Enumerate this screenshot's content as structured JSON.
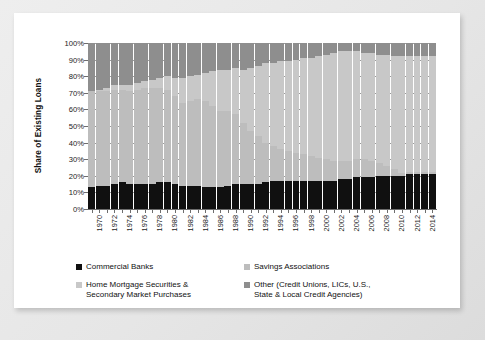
{
  "chart_data": {
    "type": "bar",
    "stacked": true,
    "stack_mode": "percent",
    "title": "",
    "xlabel": "",
    "ylabel": "Share of Existing Loans",
    "ylim": [
      0,
      100
    ],
    "ytick_labels": [
      "0%",
      "10%",
      "20%",
      "30%",
      "40%",
      "50%",
      "60%",
      "70%",
      "80%",
      "90%",
      "100%"
    ],
    "ytick_values": [
      0,
      10,
      20,
      30,
      40,
      50,
      60,
      70,
      80,
      90,
      100
    ],
    "grid": "horizontal-dashed",
    "legend_position": "bottom",
    "categories": [
      1970,
      1971,
      1972,
      1973,
      1974,
      1975,
      1976,
      1977,
      1978,
      1979,
      1980,
      1981,
      1982,
      1983,
      1984,
      1985,
      1986,
      1987,
      1988,
      1989,
      1990,
      1991,
      1992,
      1993,
      1994,
      1995,
      1996,
      1997,
      1998,
      1999,
      2000,
      2001,
      2002,
      2003,
      2004,
      2005,
      2006,
      2007,
      2008,
      2009,
      2010,
      2011,
      2012,
      2013,
      2014,
      2015
    ],
    "xtick_labels": [
      "1970",
      "1972",
      "1974",
      "1976",
      "1978",
      "1980",
      "1982",
      "1984",
      "1986",
      "1988",
      "1990",
      "1992",
      "1994",
      "1996",
      "1998",
      "2000",
      "2002",
      "2004",
      "2006",
      "2008",
      "2010",
      "2012",
      "2014"
    ],
    "series": [
      {
        "name": "Commercial Banks",
        "color": "#101010",
        "values": [
          13,
          14,
          14,
          15,
          16,
          15,
          15,
          15,
          15,
          16,
          16,
          15,
          14,
          14,
          14,
          13,
          13,
          13,
          14,
          15,
          15,
          15,
          15,
          16,
          17,
          17,
          17,
          17,
          17,
          17,
          17,
          17,
          17,
          18,
          18,
          19,
          19,
          19,
          20,
          20,
          20,
          20,
          21,
          21,
          21,
          21
        ]
      },
      {
        "name": "Savings Associations",
        "color": "#bdbdbd",
        "values": [
          58,
          57,
          57,
          57,
          56,
          56,
          57,
          58,
          58,
          57,
          56,
          53,
          50,
          51,
          52,
          52,
          49,
          46,
          45,
          42,
          37,
          32,
          29,
          24,
          21,
          19,
          18,
          17,
          16,
          15,
          14,
          13,
          12,
          11,
          11,
          11,
          11,
          10,
          8,
          6,
          4,
          2,
          1,
          1,
          1,
          1
        ]
      },
      {
        "name": "Home Mortgage Securities & Secondary Market Purchases",
        "color": "#c8c8c8",
        "values": [
          0,
          1,
          2,
          3,
          3,
          4,
          4,
          4,
          5,
          6,
          8,
          11,
          15,
          15,
          15,
          17,
          21,
          25,
          25,
          28,
          32,
          38,
          42,
          48,
          50,
          53,
          54,
          56,
          58,
          59,
          61,
          63,
          65,
          66,
          66,
          65,
          64,
          65,
          65,
          67,
          68,
          70,
          70,
          70,
          70,
          70
        ]
      },
      {
        "name": "Other (Credit Unions, LICs, U.S., State & Local Credit Agencies)",
        "color": "#8e8e8e",
        "values": [
          29,
          28,
          27,
          25,
          25,
          25,
          24,
          23,
          22,
          21,
          20,
          21,
          21,
          20,
          19,
          18,
          17,
          16,
          16,
          15,
          16,
          15,
          14,
          12,
          12,
          11,
          11,
          10,
          9,
          9,
          8,
          7,
          6,
          5,
          5,
          5,
          6,
          6,
          7,
          7,
          8,
          8,
          8,
          8,
          8,
          8
        ]
      }
    ]
  },
  "legend": {
    "items": [
      {
        "label": "Commercial Banks",
        "label_line2": "",
        "color": "#101010"
      },
      {
        "label": "Savings Associations",
        "label_line2": "",
        "color": "#bdbdbd"
      },
      {
        "label": "Home Mortgage Securities &",
        "label_line2": "Secondary Market Purchases",
        "color": "#c8c8c8"
      },
      {
        "label": "Other (Credit Unions, LICs, U.S.,",
        "label_line2": "State & Local Credit Agencies)",
        "color": "#8e8e8e"
      }
    ]
  }
}
